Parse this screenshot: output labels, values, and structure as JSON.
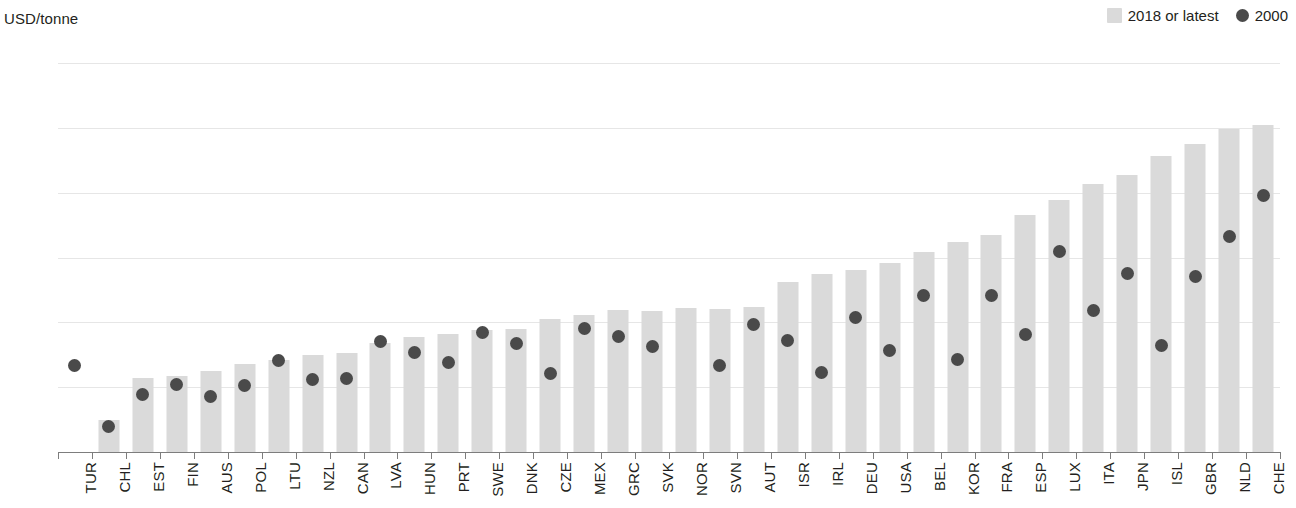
{
  "axis": {
    "unit_label": "USD/tonne",
    "y_ticks": [
      "6000",
      "5000",
      "4000",
      "3000",
      "2000",
      "1000",
      "0"
    ]
  },
  "legend": {
    "bar_label": "2018 or latest",
    "dot_label": "2000",
    "bar_color": "#dadada",
    "dot_color": "#4a4a4a"
  },
  "chart_data": {
    "type": "bar",
    "title": "",
    "subtitle": "",
    "xlabel": "",
    "ylabel": "USD/tonne",
    "ylim": [
      0,
      6000
    ],
    "ytick_step": 1000,
    "grid": true,
    "legend_position": "top-right",
    "categories": [
      "TUR",
      "CHL",
      "EST",
      "FIN",
      "AUS",
      "POL",
      "LTU",
      "NZL",
      "CAN",
      "LVA",
      "HUN",
      "PRT",
      "SWE",
      "DNK",
      "CZE",
      "MEX",
      "GRC",
      "SVK",
      "NOR",
      "SVN",
      "AUT",
      "ISR",
      "IRL",
      "DEU",
      "USA",
      "BEL",
      "KOR",
      "FRA",
      "ESP",
      "LUX",
      "ITA",
      "JPN",
      "ISL",
      "GBR",
      "NLD",
      "CHE"
    ],
    "series": [
      {
        "name": "2018 or latest",
        "type": "bar",
        "color": "#dadada",
        "values": [
          null,
          490,
          1140,
          1170,
          1250,
          1360,
          1420,
          1490,
          1530,
          1680,
          1780,
          1820,
          1880,
          1900,
          2050,
          2120,
          2190,
          2170,
          2220,
          2210,
          2240,
          2630,
          2740,
          2810,
          2910,
          3090,
          3240,
          3350,
          3650,
          3880,
          4140,
          4280,
          4570,
          4750,
          4980,
          5050
        ]
      },
      {
        "name": "2000",
        "type": "scatter",
        "color": "#4a4a4a",
        "values": [
          1330,
          400,
          890,
          1040,
          850,
          1030,
          1410,
          1120,
          1130,
          1710,
          1530,
          1380,
          1840,
          1670,
          1210,
          1900,
          1780,
          1620,
          null,
          1340,
          1960,
          1720,
          1230,
          2080,
          1570,
          2420,
          1420,
          2420,
          1810,
          3090,
          2190,
          2760,
          1640,
          2700,
          3320,
          3950
        ]
      }
    ]
  }
}
